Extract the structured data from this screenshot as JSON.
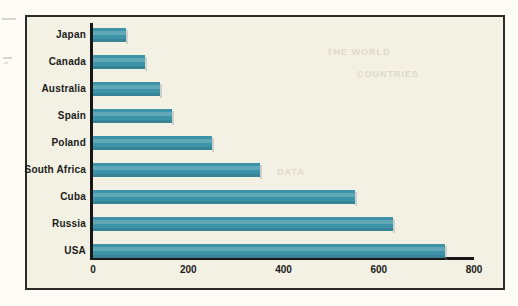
{
  "chart_data": {
    "type": "bar",
    "orientation": "horizontal",
    "title": "",
    "xlabel": "",
    "ylabel": "",
    "categories": [
      "Japan",
      "Canada",
      "Australia",
      "Spain",
      "Poland",
      "South Africa",
      "Cuba",
      "Russia",
      "USA"
    ],
    "values": [
      70,
      110,
      140,
      165,
      250,
      350,
      550,
      630,
      740
    ],
    "xlim": [
      0,
      800
    ],
    "xticks": [
      0,
      200,
      400,
      600,
      800
    ],
    "xtick_labels": [
      "0",
      "200",
      "400",
      "600",
      "800"
    ],
    "grid": false,
    "legend": null,
    "bar_color": "#3d94a8",
    "background_color": "#f3f0e4",
    "axis_color": "#17171a",
    "label_color": "#1c1c1a"
  },
  "frame": {
    "border_color": "#2b2b28"
  },
  "bleed_text": {
    "line1": "THE WORLD",
    "line2": "COUNTRIES",
    "line3": "DATA"
  }
}
